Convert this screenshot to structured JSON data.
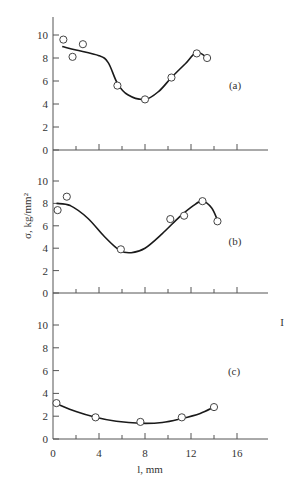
{
  "chart_data": {
    "type": "scatter",
    "layout": "three vertically stacked panels sharing one x-axis",
    "xlabel": "l, mm",
    "ylabel": "σ, kg/mm²",
    "x_ticks": [
      0,
      4,
      8,
      12,
      16
    ],
    "x_minor_ticks": [
      2,
      6,
      10,
      14
    ],
    "xlim": [
      0,
      18.5
    ],
    "y_ticks": [
      0,
      2,
      4,
      6,
      8,
      10
    ],
    "ylim": [
      0,
      11.5
    ],
    "grid": false,
    "side_marker": "I",
    "panels": [
      {
        "label": "(a)",
        "points": [
          [
            0.9,
            9.6
          ],
          [
            1.7,
            8.1
          ],
          [
            2.6,
            9.2
          ],
          [
            5.6,
            5.6
          ],
          [
            8.0,
            4.4
          ],
          [
            10.3,
            6.3
          ],
          [
            12.5,
            8.4
          ],
          [
            13.4,
            8.0
          ]
        ],
        "curve": [
          [
            0.8,
            9.0
          ],
          [
            2.0,
            8.7
          ],
          [
            4.0,
            8.2
          ],
          [
            4.8,
            7.6
          ],
          [
            5.6,
            5.8
          ],
          [
            6.5,
            4.8
          ],
          [
            8.0,
            4.4
          ],
          [
            9.2,
            5.1
          ],
          [
            10.3,
            6.3
          ],
          [
            11.5,
            7.5
          ],
          [
            12.5,
            8.5
          ],
          [
            13.4,
            8.0
          ]
        ]
      },
      {
        "label": "(b)",
        "points": [
          [
            0.4,
            7.4
          ],
          [
            1.2,
            8.6
          ],
          [
            5.9,
            3.9
          ],
          [
            10.2,
            6.6
          ],
          [
            11.4,
            6.9
          ],
          [
            13.0,
            8.2
          ],
          [
            14.3,
            6.4
          ]
        ],
        "curve": [
          [
            0.3,
            8.0
          ],
          [
            1.5,
            7.8
          ],
          [
            3.0,
            6.7
          ],
          [
            4.5,
            5.0
          ],
          [
            5.8,
            3.8
          ],
          [
            6.8,
            3.6
          ],
          [
            8.0,
            4.0
          ],
          [
            9.5,
            5.3
          ],
          [
            11.0,
            6.8
          ],
          [
            12.2,
            7.8
          ],
          [
            13.0,
            8.2
          ],
          [
            13.8,
            7.6
          ],
          [
            14.3,
            6.5
          ]
        ]
      },
      {
        "label": "(c)",
        "points": [
          [
            0.3,
            3.15
          ],
          [
            3.7,
            1.9
          ],
          [
            7.6,
            1.5
          ],
          [
            11.2,
            1.9
          ],
          [
            14.0,
            2.8
          ]
        ],
        "curve": [
          [
            0.3,
            3.1
          ],
          [
            2.0,
            2.4
          ],
          [
            3.7,
            1.9
          ],
          [
            5.5,
            1.55
          ],
          [
            7.6,
            1.38
          ],
          [
            9.5,
            1.45
          ],
          [
            11.2,
            1.8
          ],
          [
            12.8,
            2.25
          ],
          [
            14.0,
            2.8
          ]
        ]
      }
    ]
  }
}
